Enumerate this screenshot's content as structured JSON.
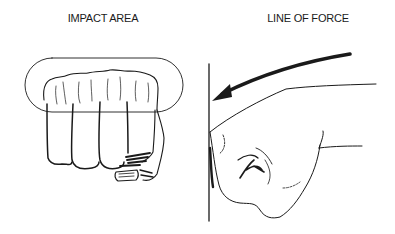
{
  "panels": [
    {
      "id": "impact-area",
      "label": "IMPACT AREA"
    },
    {
      "id": "line-of-force",
      "label": "LINE OF FORCE"
    }
  ],
  "colors": {
    "ink": "#1a1a1a",
    "background": "#ffffff"
  }
}
